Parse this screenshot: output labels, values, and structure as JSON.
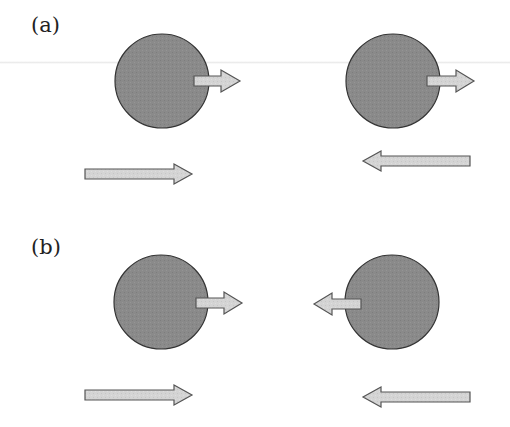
{
  "diagram": {
    "panels": [
      {
        "label": "(a)",
        "bodies": [
          {
            "id": "a-left",
            "cx": 162,
            "cy": 81,
            "r": 47,
            "velocity_arrow": "right"
          },
          {
            "id": "a-right",
            "cx": 393,
            "cy": 81,
            "r": 47,
            "velocity_arrow": "right"
          }
        ],
        "frame_arrows": [
          {
            "id": "a-frame-left",
            "direction": "right"
          },
          {
            "id": "a-frame-right",
            "direction": "left"
          }
        ]
      },
      {
        "label": "(b)",
        "bodies": [
          {
            "id": "b-left",
            "cx": 161,
            "cy": 302,
            "r": 47,
            "velocity_arrow": "right"
          },
          {
            "id": "b-right",
            "cx": 392,
            "cy": 302,
            "r": 47,
            "velocity_arrow": "left"
          }
        ],
        "frame_arrows": [
          {
            "id": "b-frame-left",
            "direction": "right"
          },
          {
            "id": "b-frame-right",
            "direction": "left"
          }
        ]
      }
    ],
    "colors": {
      "circle_fill": "#8a8a8a",
      "circle_stroke": "#333333",
      "arrow_fill": "#d4d4d4",
      "arrow_stroke": "#555555",
      "label": "#222222"
    }
  }
}
